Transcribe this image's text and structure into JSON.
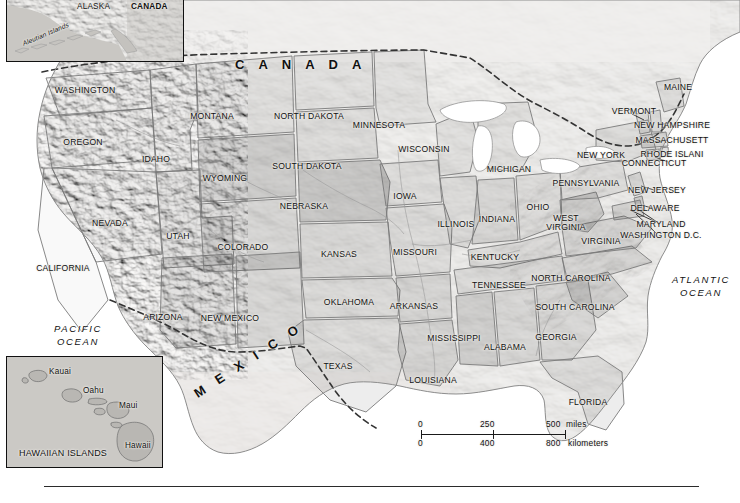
{
  "map": {
    "title": "United States reference map with Alaska and Hawaii insets",
    "projection_note": "Shaded relief physical/political map",
    "colors": {
      "land": "#d2d0cb",
      "land_light": "#e3e1dd",
      "land_shaded": "#bcbab5",
      "water": "#ffffff",
      "border": "#6d6d6d",
      "national_border": "#3a3a3a",
      "label": "#111111",
      "inset_border": "#111111"
    }
  },
  "countries": [
    {
      "name": "CANADA",
      "x": 235,
      "y": 58
    },
    {
      "name": "MEXICO",
      "x": 195,
      "y": 385
    }
  ],
  "oceans": [
    {
      "name": "PACIFIC",
      "second": "OCEAN",
      "x": 42,
      "y": 324
    },
    {
      "name": "ATLANTIC",
      "second": "OCEAN",
      "x": 668,
      "y": 275
    }
  ],
  "states": [
    {
      "name": "WASHINGTON",
      "x": 85,
      "y": 90
    },
    {
      "name": "OREGON",
      "x": 83,
      "y": 142
    },
    {
      "name": "IDAHO",
      "x": 156,
      "y": 159
    },
    {
      "name": "MONTANA",
      "x": 212,
      "y": 116
    },
    {
      "name": "WYOMING",
      "x": 225,
      "y": 178
    },
    {
      "name": "NEVADA",
      "x": 110,
      "y": 223
    },
    {
      "name": "UTAH",
      "x": 178,
      "y": 236
    },
    {
      "name": "CALIFORNIA",
      "x": 63,
      "y": 268
    },
    {
      "name": "ARIZONA",
      "x": 163,
      "y": 317
    },
    {
      "name": "COLORADO",
      "x": 243,
      "y": 247
    },
    {
      "name": "NEW MEXICO",
      "x": 230,
      "y": 318
    },
    {
      "name": "NORTH DAKOTA",
      "x": 309,
      "y": 116
    },
    {
      "name": "SOUTH DAKOTA",
      "x": 307,
      "y": 166
    },
    {
      "name": "NEBRASKA",
      "x": 304,
      "y": 206
    },
    {
      "name": "KANSAS",
      "x": 339,
      "y": 254
    },
    {
      "name": "OKLAHOMA",
      "x": 349,
      "y": 302
    },
    {
      "name": "TEXAS",
      "x": 338,
      "y": 366
    },
    {
      "name": "MINNESOTA",
      "x": 379,
      "y": 125
    },
    {
      "name": "IOWA",
      "x": 405,
      "y": 196
    },
    {
      "name": "MISSOURI",
      "x": 415,
      "y": 252
    },
    {
      "name": "ARKANSAS",
      "x": 414,
      "y": 306
    },
    {
      "name": "LOUISIANA",
      "x": 433,
      "y": 380
    },
    {
      "name": "WISCONSIN",
      "x": 424,
      "y": 149
    },
    {
      "name": "ILLINOIS",
      "x": 456,
      "y": 224
    },
    {
      "name": "MICHIGAN",
      "x": 509,
      "y": 169
    },
    {
      "name": "INDIANA",
      "x": 497,
      "y": 219
    },
    {
      "name": "OHIO",
      "x": 538,
      "y": 207
    },
    {
      "name": "KENTUCKY",
      "x": 495,
      "y": 257
    },
    {
      "name": "TENNESSEE",
      "x": 499,
      "y": 285
    },
    {
      "name": "MISSISSIPPI",
      "x": 454,
      "y": 338
    },
    {
      "name": "ALABAMA",
      "x": 505,
      "y": 347
    },
    {
      "name": "GEORGIA",
      "x": 556,
      "y": 337
    },
    {
      "name": "FLORIDA",
      "x": 588,
      "y": 402
    },
    {
      "name": "SOUTH CAROLINA",
      "x": 575,
      "y": 307
    },
    {
      "name": "NORTH CAROLINA",
      "x": 571,
      "y": 278
    },
    {
      "name": "VIRGINIA",
      "x": 601,
      "y": 241
    },
    {
      "name": "WEST VIRGINIA",
      "x": 566,
      "y": 223,
      "two_line": true
    },
    {
      "name": "PENNSYLVANIA",
      "x": 586,
      "y": 183
    },
    {
      "name": "NEW YORK",
      "x": 601,
      "y": 155
    },
    {
      "name": "VERMONT",
      "x": 634,
      "y": 111
    },
    {
      "name": "MAINE",
      "x": 678,
      "y": 87
    },
    {
      "name": "NEW HAMPSHIRE",
      "x": 672,
      "y": 125
    },
    {
      "name": "MASSACHUSETT",
      "x": 672,
      "y": 140
    },
    {
      "name": "RHODE ISLANI",
      "x": 672,
      "y": 154
    },
    {
      "name": "CONNECTICUT",
      "x": 654,
      "y": 163
    },
    {
      "name": "NEW JERSEY",
      "x": 657,
      "y": 190
    },
    {
      "name": "DELAWARE",
      "x": 655,
      "y": 208
    },
    {
      "name": "MARYLAND",
      "x": 661,
      "y": 224
    },
    {
      "name": "WASHINGTON D.C.",
      "x": 661,
      "y": 235
    }
  ],
  "west_virginia_lines": [
    "WEST",
    "VIRGINIA"
  ],
  "alaska_inset": {
    "labels": [
      {
        "name": "ALASKA",
        "x": 74,
        "y": 6,
        "bold": false
      },
      {
        "name": "CANADA",
        "x": 128,
        "y": 5,
        "bold": true
      },
      {
        "name": "Aleutian Islands",
        "x": 22,
        "y": 46,
        "rotated": true
      }
    ]
  },
  "hawaii_inset": {
    "labels": [
      {
        "name": "Kauai",
        "x": 41,
        "y": 368
      },
      {
        "name": "Oahu",
        "x": 77,
        "y": 385
      },
      {
        "name": "Maui",
        "x": 122,
        "y": 400
      },
      {
        "name": "Hawaii",
        "x": 128,
        "y": 441
      },
      {
        "name": "HAWAIIAN ISLANDS",
        "x": 18,
        "y": 450
      }
    ]
  },
  "scale_bar": {
    "miles": {
      "ticks": [
        "0",
        "250",
        "500"
      ],
      "unit": "miles"
    },
    "kilometers": {
      "ticks": [
        "0",
        "400",
        "800"
      ],
      "unit": "kilometers"
    }
  }
}
